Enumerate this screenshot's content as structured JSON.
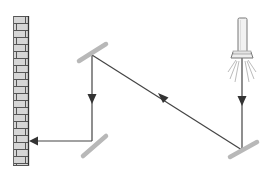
{
  "title": "Light beam reflecting off three mirrors onto a brick wall",
  "components": {
    "light_source": {
      "icon": "flashlight-icon",
      "label": "Flashlight"
    },
    "mirrors": [
      {
        "id": "mirror-top-left",
        "label": "Mirror 1"
      },
      {
        "id": "mirror-bottom-left",
        "label": "Mirror 2"
      },
      {
        "id": "mirror-bottom-right",
        "label": "Mirror 3"
      }
    ],
    "wall": {
      "icon": "brick-wall-icon",
      "label": "Brick wall"
    }
  },
  "beam_path": [
    "flashlight down to bottom-right mirror",
    "bottom-right mirror up-left to top-left mirror",
    "top-left mirror down to bottom-left mirror",
    "bottom-left mirror left to wall"
  ],
  "colors": {
    "beam": "#444444",
    "arrow": "#333333",
    "mirror": "#b8b8b8",
    "brick_fill": "#d6d6d6",
    "mortar": "#555555",
    "flashlight_body": "#f2f2f2",
    "flashlight_outline": "#777777",
    "rays": "#aaaaaa"
  }
}
